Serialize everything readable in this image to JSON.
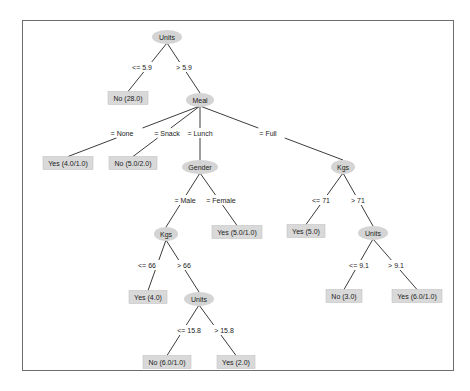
{
  "diagram": {
    "type": "decision-tree",
    "colors": {
      "frame": "#6e6e6e",
      "edge": "#3c3c3c",
      "inner_node_fill": "#d4d4d4",
      "leaf_fill": "#d9d9d9",
      "text": "#222222"
    },
    "nodes": [
      {
        "id": "n_units_root",
        "kind": "inner",
        "label": "Units",
        "x": 167,
        "y": 37,
        "w": 30,
        "h": 14
      },
      {
        "id": "n_no_28",
        "kind": "leaf",
        "label": "No (28.0)",
        "x": 128,
        "y": 98,
        "w": 40,
        "h": 13
      },
      {
        "id": "n_meal",
        "kind": "inner",
        "label": "Meal",
        "x": 200,
        "y": 100,
        "w": 28,
        "h": 14
      },
      {
        "id": "n_yes_4_1",
        "kind": "leaf",
        "label": "Yes (4.0/1.0)",
        "x": 68,
        "y": 163,
        "w": 50,
        "h": 13
      },
      {
        "id": "n_no_5_2",
        "kind": "leaf",
        "label": "No (5.0/2.0)",
        "x": 133,
        "y": 163,
        "w": 48,
        "h": 13
      },
      {
        "id": "n_gender",
        "kind": "inner",
        "label": "Gender",
        "x": 200,
        "y": 167,
        "w": 36,
        "h": 14
      },
      {
        "id": "n_kgs_full",
        "kind": "inner",
        "label": "Kgs",
        "x": 343,
        "y": 167,
        "w": 24,
        "h": 14
      },
      {
        "id": "n_kgs_male",
        "kind": "inner",
        "label": "Kgs",
        "x": 166,
        "y": 234,
        "w": 24,
        "h": 14
      },
      {
        "id": "n_yes_5_1",
        "kind": "leaf",
        "label": "Yes (5.0/1.0)",
        "x": 237,
        "y": 232,
        "w": 50,
        "h": 13
      },
      {
        "id": "n_yes_5",
        "kind": "leaf",
        "label": "Yes (5.0)",
        "x": 306,
        "y": 231,
        "w": 38,
        "h": 13
      },
      {
        "id": "n_units_71",
        "kind": "inner",
        "label": "Units",
        "x": 373,
        "y": 233,
        "w": 30,
        "h": 14
      },
      {
        "id": "n_yes_4",
        "kind": "leaf",
        "label": "Yes (4.0)",
        "x": 148,
        "y": 297,
        "w": 38,
        "h": 13
      },
      {
        "id": "n_units_66",
        "kind": "inner",
        "label": "Units",
        "x": 199,
        "y": 299,
        "w": 30,
        "h": 14
      },
      {
        "id": "n_no_3",
        "kind": "leaf",
        "label": "No (3.0)",
        "x": 344,
        "y": 296,
        "w": 36,
        "h": 13
      },
      {
        "id": "n_yes_6_1",
        "kind": "leaf",
        "label": "Yes (6.0/1.0)",
        "x": 417,
        "y": 296,
        "w": 50,
        "h": 13
      },
      {
        "id": "n_no_6_1",
        "kind": "leaf",
        "label": "No (6.0/1.0)",
        "x": 167,
        "y": 362,
        "w": 48,
        "h": 13
      },
      {
        "id": "n_yes_2",
        "kind": "leaf",
        "label": "Yes (2.0)",
        "x": 236,
        "y": 362,
        "w": 38,
        "h": 13
      }
    ],
    "edges": [
      {
        "from": "n_units_root",
        "to": "n_no_28",
        "label": "<= 5.9",
        "lx": 142,
        "ly": 67
      },
      {
        "from": "n_units_root",
        "to": "n_meal",
        "label": "> 5.9",
        "lx": 184,
        "ly": 67
      },
      {
        "from": "n_meal",
        "to": "n_yes_4_1",
        "label": "= None",
        "lx": 122,
        "ly": 133
      },
      {
        "from": "n_meal",
        "to": "n_no_5_2",
        "label": "= Snack",
        "lx": 167,
        "ly": 133
      },
      {
        "from": "n_meal",
        "to": "n_gender",
        "label": "= Lunch",
        "lx": 200,
        "ly": 133
      },
      {
        "from": "n_meal",
        "to": "n_kgs_full",
        "label": "= Full",
        "lx": 268,
        "ly": 133
      },
      {
        "from": "n_gender",
        "to": "n_kgs_male",
        "label": "= Male",
        "lx": 185,
        "ly": 200
      },
      {
        "from": "n_gender",
        "to": "n_yes_5_1",
        "label": "= Female",
        "lx": 221,
        "ly": 200
      },
      {
        "from": "n_kgs_full",
        "to": "n_yes_5",
        "label": "<= 71",
        "lx": 321,
        "ly": 200
      },
      {
        "from": "n_kgs_full",
        "to": "n_units_71",
        "label": "> 71",
        "lx": 358,
        "ly": 200
      },
      {
        "from": "n_kgs_male",
        "to": "n_yes_4",
        "label": "<= 66",
        "lx": 147,
        "ly": 265
      },
      {
        "from": "n_kgs_male",
        "to": "n_units_66",
        "label": "> 66",
        "lx": 184,
        "ly": 265
      },
      {
        "from": "n_units_71",
        "to": "n_no_3",
        "label": "<= 9.1",
        "lx": 359,
        "ly": 265
      },
      {
        "from": "n_units_71",
        "to": "n_yes_6_1",
        "label": "> 9.1",
        "lx": 396,
        "ly": 265
      },
      {
        "from": "n_units_66",
        "to": "n_no_6_1",
        "label": "<= 15.8",
        "lx": 189,
        "ly": 330
      },
      {
        "from": "n_units_66",
        "to": "n_yes_2",
        "label": "> 15.8",
        "lx": 224,
        "ly": 330
      }
    ]
  }
}
